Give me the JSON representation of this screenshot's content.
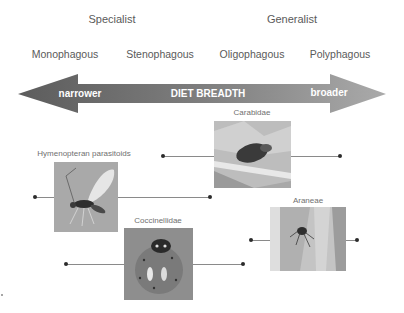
{
  "categories": {
    "specialist": "Specialist",
    "generalist": "Generalist"
  },
  "diet_types": [
    "Monophagous",
    "Stenophagous",
    "Oligophagous",
    "Polyphagous"
  ],
  "arrow": {
    "left_label": "narrower",
    "center_label": "DIET BREADTH",
    "right_label": "broader",
    "color_left": "#5e5e5e",
    "color_right": "#a6a6a6"
  },
  "taxa": [
    {
      "name": "Carabidae",
      "image": "ground-beetle-photo"
    },
    {
      "name": "Hymenopteran parasitoids",
      "image": "parasitoid-wasp-photo"
    },
    {
      "name": "Coccinellidae",
      "image": "ladybird-beetle-photo"
    },
    {
      "name": "Araneae",
      "image": "spider-photo"
    }
  ]
}
